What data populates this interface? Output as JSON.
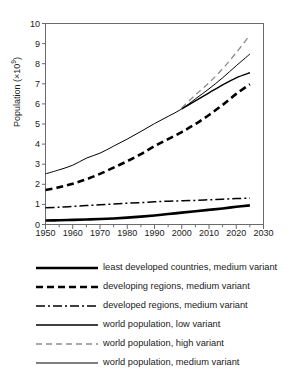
{
  "chart_data": {
    "type": "line",
    "title": "",
    "xlabel": "",
    "ylabel": "Population (×10⁹)",
    "ylabel_main": "Population (×10",
    "ylabel_exp": "9",
    "ylabel_tail": ")",
    "xlim": [
      1950,
      2030
    ],
    "ylim": [
      0,
      10
    ],
    "xticks": [
      1950,
      1960,
      1970,
      1980,
      1990,
      2000,
      2010,
      2020,
      2030
    ],
    "xminor_step": 5,
    "yticks": [
      0,
      1,
      2,
      3,
      4,
      5,
      6,
      7,
      8,
      9,
      10
    ],
    "grid": false,
    "legend_position": "below",
    "series": [
      {
        "name": "least developed countries, medium variant",
        "style": "thick-solid",
        "color": "#000000",
        "width": 2.6,
        "dash": "",
        "x": [
          1950,
          1955,
          1960,
          1965,
          1970,
          1975,
          1980,
          1985,
          1990,
          1995,
          2000,
          2005,
          2010,
          2015,
          2020,
          2025
        ],
        "values": [
          0.2,
          0.21,
          0.23,
          0.25,
          0.27,
          0.3,
          0.34,
          0.39,
          0.45,
          0.52,
          0.59,
          0.66,
          0.73,
          0.8,
          0.88,
          0.95
        ]
      },
      {
        "name": "developing regions, medium variant",
        "style": "thick-dashed",
        "color": "#000000",
        "width": 2.6,
        "dash": "7,4",
        "x": [
          1950,
          1955,
          1960,
          1965,
          1970,
          1975,
          1980,
          1985,
          1990,
          1995,
          2000,
          2005,
          2010,
          2015,
          2020,
          2025
        ],
        "values": [
          1.72,
          1.85,
          2.03,
          2.25,
          2.52,
          2.83,
          3.15,
          3.5,
          3.9,
          4.25,
          4.6,
          5.0,
          5.45,
          5.95,
          6.5,
          6.98
        ]
      },
      {
        "name": "developed regions, medium variant",
        "style": "dash-dot",
        "color": "#000000",
        "width": 1.5,
        "dash": "9,3,2,3",
        "x": [
          1950,
          1955,
          1960,
          1965,
          1970,
          1975,
          1980,
          1985,
          1990,
          1995,
          2000,
          2005,
          2010,
          2015,
          2020,
          2025
        ],
        "values": [
          0.83,
          0.86,
          0.9,
          0.94,
          0.98,
          1.02,
          1.06,
          1.09,
          1.13,
          1.16,
          1.18,
          1.2,
          1.23,
          1.26,
          1.29,
          1.31
        ]
      },
      {
        "name": "world population, low variant",
        "style": "medium-solid",
        "color": "#000000",
        "width": 1.4,
        "dash": "",
        "x": [
          2000,
          2005,
          2010,
          2015,
          2020,
          2025
        ],
        "values": [
          5.75,
          6.15,
          6.55,
          6.95,
          7.3,
          7.55
        ]
      },
      {
        "name": "world population, high variant",
        "style": "gray-dashed",
        "color": "#8c8c8c",
        "width": 1.3,
        "dash": "6,4",
        "x": [
          2000,
          2005,
          2010,
          2015,
          2020,
          2025
        ],
        "values": [
          5.8,
          6.45,
          7.05,
          7.75,
          8.55,
          9.42
        ]
      },
      {
        "name": "world population, medium variant",
        "style": "thin-solid",
        "color": "#000000",
        "width": 1.0,
        "dash": "",
        "x": [
          1950,
          1955,
          1960,
          1965,
          1970,
          1975,
          1980,
          1985,
          1990,
          1995,
          2000,
          2005,
          2010,
          2015,
          2020,
          2025
        ],
        "values": [
          2.52,
          2.72,
          2.95,
          3.3,
          3.55,
          3.9,
          4.25,
          4.63,
          5.02,
          5.38,
          5.75,
          6.25,
          6.75,
          7.3,
          7.9,
          8.48
        ]
      }
    ]
  },
  "legend": {
    "items": [
      {
        "label": "least developed countries, medium variant",
        "sample": "thick-solid"
      },
      {
        "label": "developing regions, medium variant",
        "sample": "thick-dashed"
      },
      {
        "label": "developed regions, medium variant",
        "sample": "dash-dot"
      },
      {
        "label": "world population, low variant",
        "sample": "medium-solid"
      },
      {
        "label": "world population, high variant",
        "sample": "gray-dashed"
      },
      {
        "label": "world population, medium variant",
        "sample": "thin-solid"
      }
    ]
  },
  "colors": {
    "axis": "#6b6b6b",
    "text": "#1a1a1a",
    "gray_series": "#8c8c8c",
    "black_series": "#000000",
    "background": "#ffffff"
  }
}
